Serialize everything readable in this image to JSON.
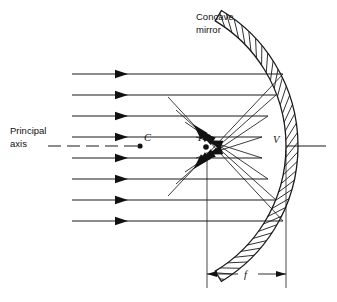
{
  "figure": {
    "background_color": "#ffffff",
    "line_color": "#1a1a1a"
  },
  "labels": {
    "mirror_line1": "Concave",
    "mirror_line2": "mirror",
    "axis_line1": "Principal",
    "axis_line2": "axis",
    "center_of_curvature": "C",
    "focal_point": "F",
    "vertex": "V",
    "focal_length": "f"
  },
  "points": {
    "C": {
      "x": 140,
      "y": 146
    },
    "F": {
      "x": 206,
      "y": 147
    },
    "V": {
      "x": 286,
      "y": 146
    }
  },
  "chart_data": {
    "type": "diagram",
    "principal_axis_y": 146,
    "incident_rays": [
      {
        "y": 74,
        "x_start": 72,
        "x_end": 283,
        "arrow_x": 128
      },
      {
        "y": 95,
        "x_start": 72,
        "x_end": 276,
        "arrow_x": 128
      },
      {
        "y": 116,
        "x_start": 72,
        "x_end": 268,
        "arrow_x": 128
      },
      {
        "y": 137,
        "x_start": 72,
        "x_end": 262,
        "arrow_x": 128
      },
      {
        "y": 158,
        "x_start": 72,
        "x_end": 262,
        "arrow_x": 128
      },
      {
        "y": 179,
        "x_start": 72,
        "x_end": 268,
        "arrow_x": 128
      },
      {
        "y": 200,
        "x_start": 72,
        "x_end": 276,
        "arrow_x": 128
      },
      {
        "y": 221,
        "x_start": 72,
        "x_end": 283,
        "arrow_x": 128
      }
    ],
    "reflected_rays": [
      {
        "from_x": 283,
        "from_y": 74,
        "to_x": 168,
        "to_y": 196,
        "arrow_at": 0.78
      },
      {
        "from_x": 276,
        "from_y": 95,
        "to_x": 176,
        "to_y": 184,
        "arrow_at": 0.8
      },
      {
        "from_x": 268,
        "from_y": 116,
        "to_x": 185,
        "to_y": 172,
        "arrow_at": 0.82
      },
      {
        "from_x": 262,
        "from_y": 137,
        "to_x": 196,
        "to_y": 158,
        "arrow_at": 0.84
      },
      {
        "from_x": 262,
        "from_y": 158,
        "to_x": 196,
        "to_y": 137,
        "arrow_at": 0.84
      },
      {
        "from_x": 268,
        "from_y": 179,
        "to_x": 185,
        "to_y": 122,
        "arrow_at": 0.82
      },
      {
        "from_x": 276,
        "from_y": 200,
        "to_x": 176,
        "to_y": 110,
        "arrow_at": 0.8
      },
      {
        "from_x": 283,
        "from_y": 221,
        "to_x": 168,
        "to_y": 97,
        "arrow_at": 0.78
      }
    ],
    "mirror": {
      "shape": "hatched_arc",
      "center_x": 140,
      "center_y": 146,
      "inner_radius": 146,
      "outer_radius": 158,
      "angle_start_deg": -59,
      "angle_end_deg": 59,
      "hatch_count": 34
    },
    "focal_length_dimension": {
      "from_x": 207,
      "to_x": 286,
      "y": 274,
      "label": "f"
    },
    "axis": {
      "dashed_from_x": 48,
      "dashed_to_x": 140,
      "solid_from_x": 286,
      "solid_to_x": 326
    }
  }
}
